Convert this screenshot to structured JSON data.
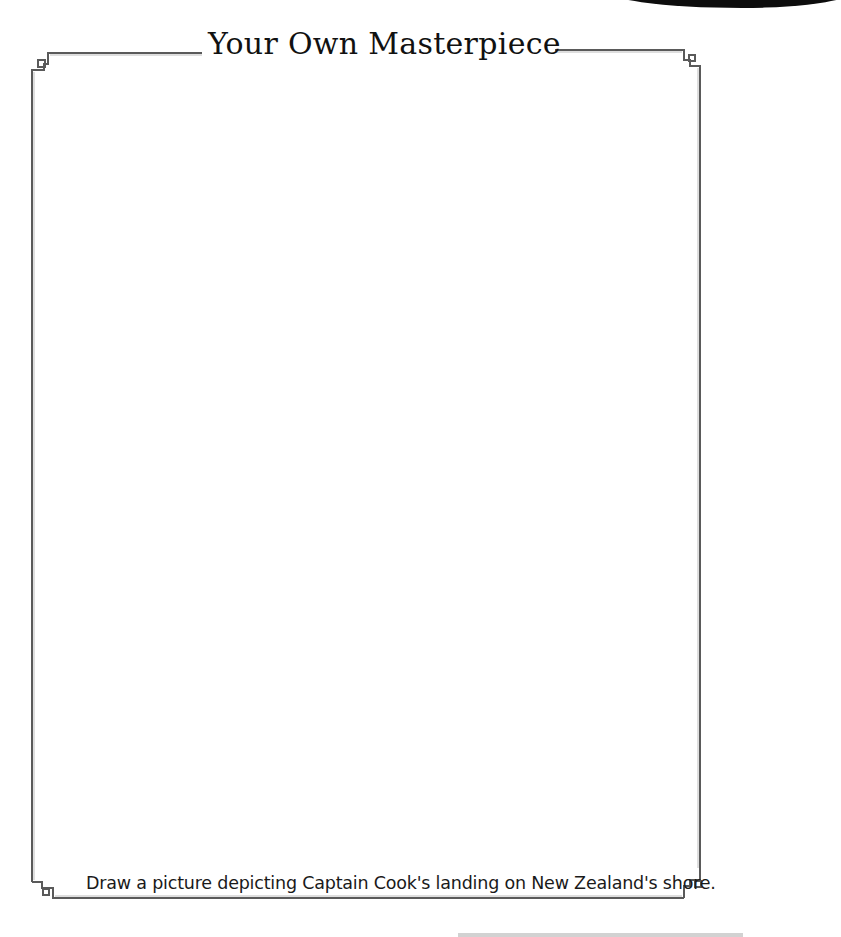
{
  "page": {
    "title": "Your Own Masterpiece",
    "caption": "Draw a picture depicting Captain Cook's landing on New Zealand's shore.",
    "drawing_area": ""
  },
  "colors": {
    "border": "#555555",
    "text": "#111111",
    "background": "#ffffff"
  }
}
